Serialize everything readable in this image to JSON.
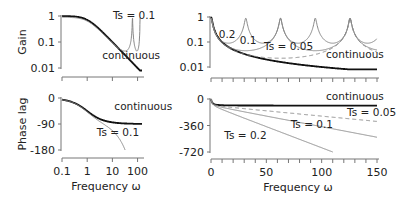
{
  "chart_data": [
    {
      "id": "gain-log",
      "type": "line",
      "xscale": "log",
      "yscale": "log",
      "xlim": [
        0.1,
        150
      ],
      "ylim": [
        0.01,
        1
      ],
      "xticks": [
        0.1,
        1,
        10,
        100
      ],
      "xtick_labels": [],
      "yticks": [
        1,
        0.1,
        0.01
      ],
      "ytick_labels": [
        "1",
        "0.1",
        "0.01"
      ],
      "ylabel": "Gain",
      "xlabel": "",
      "grid": false,
      "annotations": [
        {
          "text": "Ts = 0.1",
          "x": 10.5,
          "y": 0.8
        },
        {
          "text": "continuous",
          "x": 4,
          "y": 0.022
        }
      ],
      "series": [
        {
          "name": "continuous",
          "style": "solid-black"
        },
        {
          "name": "Ts = 0.1",
          "style": "solid-gray",
          "Ts": 0.1
        }
      ]
    },
    {
      "id": "phase-log",
      "type": "line",
      "xscale": "log",
      "yscale": "linear",
      "xlim": [
        0.1,
        150
      ],
      "ylim": [
        -180,
        0
      ],
      "xticks": [
        0.1,
        1,
        10,
        100
      ],
      "xtick_labels": [
        "0.1",
        "1",
        "10",
        "100"
      ],
      "yticks": [
        0,
        -90,
        -180
      ],
      "ytick_labels": [
        "0",
        "-90",
        "-180"
      ],
      "ylabel": "Phase lag",
      "xlabel": "Frequency  ω",
      "grid": false,
      "annotations": [
        {
          "text": "continuous",
          "x": 12,
          "y": -40
        },
        {
          "text": "Ts = 0.1",
          "x": 2.4,
          "y": -130
        }
      ],
      "series": [
        {
          "name": "continuous",
          "style": "solid-black"
        },
        {
          "name": "Ts = 0.1",
          "style": "solid-gray",
          "Ts": 0.1
        }
      ]
    },
    {
      "id": "gain-linear",
      "type": "line",
      "xscale": "linear",
      "yscale": "log",
      "xlim": [
        0,
        150
      ],
      "ylim": [
        0.01,
        1
      ],
      "xticks": [
        0,
        10,
        20,
        30,
        40,
        50,
        60,
        70,
        80,
        90,
        100,
        110,
        120,
        130,
        140,
        150
      ],
      "xtick_labels": [],
      "yticks": [
        1,
        0.1,
        0.01
      ],
      "ytick_labels": [
        "1",
        "0.1",
        "0.01"
      ],
      "ylabel": "",
      "xlabel": "",
      "grid": false,
      "annotations": [
        {
          "text": "0.2",
          "x": 7,
          "y": 0.15
        },
        {
          "text": "0.1",
          "x": 26,
          "y": 0.085
        },
        {
          "text": "Ts = 0.05",
          "x": 48,
          "y": 0.05
        },
        {
          "text": "continuous",
          "x": 104,
          "y": 0.022
        }
      ],
      "series": [
        {
          "name": "continuous",
          "style": "solid-black"
        },
        {
          "name": "Ts = 0.2",
          "style": "solid-gray",
          "Ts": 0.2
        },
        {
          "name": "Ts = 0.1",
          "style": "solid-gray",
          "Ts": 0.1
        },
        {
          "name": "Ts = 0.05",
          "style": "dashed-gray",
          "Ts": 0.05
        }
      ]
    },
    {
      "id": "phase-linear",
      "type": "line",
      "xscale": "linear",
      "yscale": "linear",
      "xlim": [
        0,
        150
      ],
      "ylim": [
        -720,
        0
      ],
      "xticks": [
        0,
        10,
        20,
        30,
        40,
        50,
        60,
        70,
        80,
        90,
        100,
        110,
        120,
        130,
        140,
        150
      ],
      "xtick_labels": [
        "0",
        "",
        "",
        "",
        "",
        "50",
        "",
        "",
        "",
        "",
        "100",
        "",
        "",
        "",
        "",
        "150"
      ],
      "yticks": [
        0,
        -360,
        -720
      ],
      "ytick_labels": [
        "0",
        "-360",
        "-720"
      ],
      "ylabel": "",
      "xlabel": "Frequency  ω",
      "grid": false,
      "annotations": [
        {
          "text": "continuous",
          "x": 104,
          "y": -20
        },
        {
          "text": "Ts = 0.05",
          "x": 123,
          "y": -225
        },
        {
          "text": "Ts = 0.1",
          "x": 72,
          "y": -390
        },
        {
          "text": "Ts = 0.2",
          "x": 12,
          "y": -540
        }
      ],
      "series": [
        {
          "name": "continuous",
          "style": "solid-black"
        },
        {
          "name": "Ts = 0.05",
          "style": "dashed-gray",
          "Ts": 0.05
        },
        {
          "name": "Ts = 0.1",
          "style": "solid-gray",
          "Ts": 0.1
        },
        {
          "name": "Ts = 0.2",
          "style": "solid-gray",
          "Ts": 0.2
        }
      ]
    }
  ]
}
